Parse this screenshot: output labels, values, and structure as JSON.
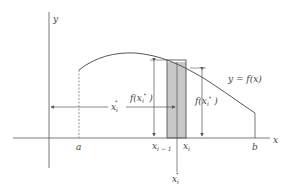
{
  "diagram": {
    "colors": {
      "line": "#6b6b6b",
      "shade": "#c8c8c8",
      "text": "#444444",
      "background": "#ffffff"
    },
    "axes": {
      "x_label": "x",
      "y_label": "y"
    },
    "curve": {
      "label": "y = f(x)"
    },
    "points": {
      "a": "a",
      "b": "b",
      "x_i_minus_1": "x",
      "x_i_minus_1_sub": "i − 1",
      "x_i": "x",
      "x_i_sub": "i",
      "x_star": "x",
      "x_star_sub": "i",
      "x_star_sup": "*"
    },
    "annotations": {
      "f_xstar_left": "f(x",
      "f_xstar_left_sub": "i",
      "f_xstar_left_sup": "*",
      "f_xstar_left_close": " )",
      "f_xstar_right": "f(x",
      "f_xstar_right_sub": "i",
      "f_xstar_right_sup": "*",
      "f_xstar_right_close": " )",
      "x_star_arrow": "x",
      "x_star_arrow_sub": "i",
      "x_star_arrow_sup": "*"
    }
  }
}
